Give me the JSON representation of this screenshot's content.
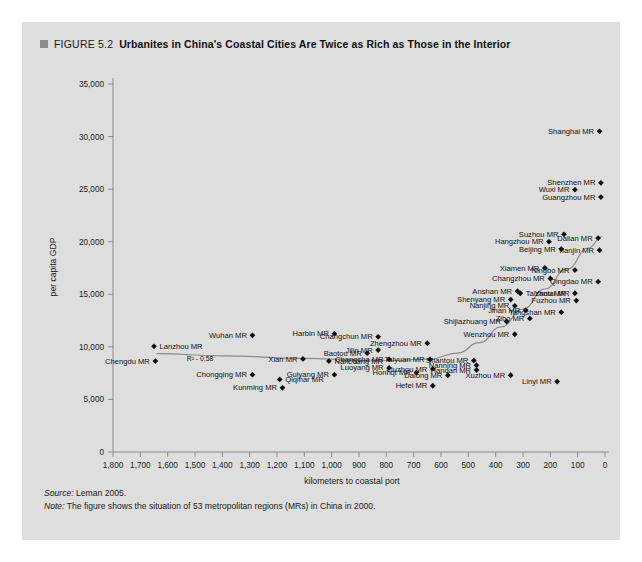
{
  "figure": {
    "number": "FIGURE 5.2",
    "title": "Urbanites in China's Coastal Cities Are Twice as Rich as Those in the Interior",
    "marker_color": "#8c8c8c",
    "panel_color": "#dedede"
  },
  "footnotes": {
    "source_lead": "Source:",
    "source_text": " Leman 2005.",
    "note_lead": "Note:",
    "note_text": " The figure shows the situation of 53 metropolitan regions (MRs) in China in 2000."
  },
  "chart_data": {
    "type": "scatter",
    "title": "Urbanites in China's Coastal Cities Are Twice as Rich as Those in the Interior",
    "xlabel": "kilometers to coastal port",
    "ylabel": "per capita GDP",
    "xlim": [
      1800,
      0
    ],
    "ylim": [
      0,
      35000
    ],
    "x_reversed": true,
    "grid": false,
    "legend": "none",
    "xticks": [
      "1,800",
      "1,700",
      "1,600",
      "1,500",
      "1,400",
      "1,300",
      "1,200",
      "1,100",
      "1,000",
      "900",
      "800",
      "700",
      "600",
      "500",
      "400",
      "300",
      "200",
      "100",
      "0"
    ],
    "xtick_values": [
      1800,
      1700,
      1600,
      1500,
      1400,
      1300,
      1200,
      1100,
      1000,
      900,
      800,
      700,
      600,
      500,
      400,
      300,
      200,
      100,
      0
    ],
    "yticks": [
      "0",
      "5,000",
      "10,000",
      "15,000",
      "20,000",
      "25,000",
      "30,000",
      "35,000"
    ],
    "ytick_values": [
      0,
      5000,
      10000,
      15000,
      20000,
      25000,
      30000,
      35000
    ],
    "annotation": {
      "text": "R² - 0.58",
      "x": 1530,
      "y": 8650
    },
    "trend_line": {
      "type": "curve",
      "description": "fitted trend rising toward the coast",
      "points": [
        [
          1640,
          9350
        ],
        [
          1400,
          9150
        ],
        [
          1100,
          8900
        ],
        [
          900,
          8750
        ],
        [
          760,
          8700
        ],
        [
          640,
          8850
        ],
        [
          540,
          9400
        ],
        [
          460,
          10400
        ],
        [
          380,
          11900
        ],
        [
          300,
          13600
        ],
        [
          220,
          15500
        ],
        [
          140,
          17400
        ],
        [
          60,
          19400
        ],
        [
          10,
          20500
        ]
      ]
    },
    "points": [
      {
        "label": "Shanghai MR",
        "x": 20,
        "y": 30500,
        "anchor": "end"
      },
      {
        "label": "Shenzhen MR",
        "x": 15,
        "y": 25600,
        "anchor": "end"
      },
      {
        "label": "Wuxi MR",
        "x": 110,
        "y": 24950,
        "anchor": "end"
      },
      {
        "label": "Guangzhou MR",
        "x": 15,
        "y": 24250,
        "anchor": "end"
      },
      {
        "label": "Suzhou MR",
        "x": 150,
        "y": 20700,
        "anchor": "end"
      },
      {
        "label": "Dalian MR",
        "x": 25,
        "y": 20350,
        "anchor": "end"
      },
      {
        "label": "Hangzhou MR",
        "x": 205,
        "y": 20000,
        "anchor": "end"
      },
      {
        "label": "Beijing MR",
        "x": 160,
        "y": 19300,
        "anchor": "end"
      },
      {
        "label": "Tianjin MR",
        "x": 20,
        "y": 19200,
        "anchor": "end"
      },
      {
        "label": "Xiamen MR",
        "x": 220,
        "y": 17500,
        "anchor": "end"
      },
      {
        "label": "Ningbo MR",
        "x": 110,
        "y": 17300,
        "anchor": "end"
      },
      {
        "label": "Changzhou MR",
        "x": 200,
        "y": 16500,
        "anchor": "end"
      },
      {
        "label": "Qingdao MR",
        "x": 25,
        "y": 16200,
        "anchor": "end"
      },
      {
        "label": "Anshan MR",
        "x": 320,
        "y": 15300,
        "anchor": "end"
      },
      {
        "label": "Taizhou MR",
        "x": 310,
        "y": 15100,
        "anchor": "start"
      },
      {
        "label": "Yantai MR",
        "x": 110,
        "y": 15100,
        "anchor": "end"
      },
      {
        "label": "Shenyang MR",
        "x": 345,
        "y": 14500,
        "anchor": "end"
      },
      {
        "label": "Fuzhou MR",
        "x": 105,
        "y": 14400,
        "anchor": "end"
      },
      {
        "label": "Nanjing MR",
        "x": 330,
        "y": 13900,
        "anchor": "end"
      },
      {
        "label": "Jinan MR",
        "x": 290,
        "y": 13500,
        "anchor": "end"
      },
      {
        "label": "Tangshan MR",
        "x": 160,
        "y": 13300,
        "anchor": "end"
      },
      {
        "label": "Shijiazhuang MR",
        "x": 360,
        "y": 12400,
        "anchor": "end"
      },
      {
        "label": "Zibo MR",
        "x": 275,
        "y": 12700,
        "anchor": "end"
      },
      {
        "label": "Wenzhou MR",
        "x": 330,
        "y": 11200,
        "anchor": "end"
      },
      {
        "label": "Harbin MR",
        "x": 990,
        "y": 11250,
        "anchor": "end"
      },
      {
        "label": "Changchun MR",
        "x": 830,
        "y": 10950,
        "anchor": "end"
      },
      {
        "label": "Wuhan MR",
        "x": 1290,
        "y": 11100,
        "anchor": "end"
      },
      {
        "label": "Zhengzhou MR",
        "x": 650,
        "y": 10350,
        "anchor": "end"
      },
      {
        "label": "Lanzhou MR",
        "x": 1650,
        "y": 10050,
        "anchor": "start"
      },
      {
        "label": "Jilin MR",
        "x": 830,
        "y": 9700,
        "anchor": "end"
      },
      {
        "label": "Baotou MR",
        "x": 870,
        "y": 9400,
        "anchor": "end"
      },
      {
        "label": "Chengdu MR",
        "x": 1645,
        "y": 8650,
        "anchor": "end"
      },
      {
        "label": "Xian MR",
        "x": 1105,
        "y": 8850,
        "anchor": "end"
      },
      {
        "label": "Nanchang MR",
        "x": 1010,
        "y": 8650,
        "anchor": "start"
      },
      {
        "label": "Changsha MR",
        "x": 790,
        "y": 8800,
        "anchor": "end"
      },
      {
        "label": "Taiyuan MR",
        "x": 640,
        "y": 8800,
        "anchor": "end"
      },
      {
        "label": "Shantou MR",
        "x": 480,
        "y": 8700,
        "anchor": "end"
      },
      {
        "label": "Luoyang MR",
        "x": 790,
        "y": 8000,
        "anchor": "end"
      },
      {
        "label": "Nanning MR",
        "x": 470,
        "y": 8250,
        "anchor": "end"
      },
      {
        "label": "Liuzhou MR",
        "x": 630,
        "y": 7900,
        "anchor": "end"
      },
      {
        "label": "Handan MR",
        "x": 470,
        "y": 7800,
        "anchor": "end"
      },
      {
        "label": "Chongqing MR",
        "x": 1290,
        "y": 7350,
        "anchor": "end"
      },
      {
        "label": "Guiyang MR",
        "x": 990,
        "y": 7350,
        "anchor": "end"
      },
      {
        "label": "Honhqt MR",
        "x": 690,
        "y": 7550,
        "anchor": "end"
      },
      {
        "label": "Dalong MR",
        "x": 575,
        "y": 7300,
        "anchor": "end"
      },
      {
        "label": "Xuzhou MR",
        "x": 345,
        "y": 7300,
        "anchor": "end"
      },
      {
        "label": "Qiqihar MR",
        "x": 1190,
        "y": 6900,
        "anchor": "start"
      },
      {
        "label": "Linyi MR",
        "x": 175,
        "y": 6700,
        "anchor": "end"
      },
      {
        "label": "Hefei MR",
        "x": 630,
        "y": 6300,
        "anchor": "end"
      },
      {
        "label": "Kunming MR",
        "x": 1180,
        "y": 6100,
        "anchor": "end"
      }
    ]
  }
}
